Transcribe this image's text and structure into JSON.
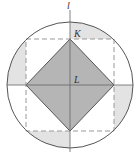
{
  "diagram": {
    "labels": {
      "line": "l",
      "vertex_top": "K",
      "center": "L"
    },
    "colors": {
      "stroke": "#555555",
      "dashed": "#999999",
      "shade_light": "#e3e3e3",
      "shade_dark": "#b5b5b5"
    }
  }
}
